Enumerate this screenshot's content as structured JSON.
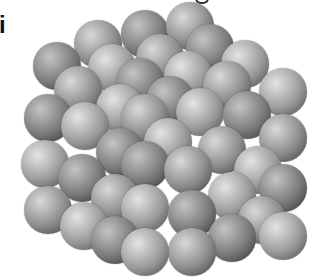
{
  "figure": {
    "label": "i",
    "sphere_radius": 24,
    "colors": {
      "highlight": "#d9d9d9",
      "mid": "#8c8c8c",
      "shadow": "#3a3a3a",
      "background": "#ffffff"
    },
    "spheres": [
      {
        "x": 98,
        "y": 44,
        "s": 0
      },
      {
        "x": 145,
        "y": 34,
        "s": 1
      },
      {
        "x": 190,
        "y": 26,
        "s": 0
      },
      {
        "x": 57,
        "y": 66,
        "s": 1
      },
      {
        "x": 112,
        "y": 68,
        "s": 2
      },
      {
        "x": 160,
        "y": 58,
        "s": 0
      },
      {
        "x": 210,
        "y": 48,
        "s": 1
      },
      {
        "x": 245,
        "y": 64,
        "s": 2
      },
      {
        "x": 140,
        "y": 82,
        "s": 1
      },
      {
        "x": 188,
        "y": 75,
        "s": 2
      },
      {
        "x": 78,
        "y": 90,
        "s": 0
      },
      {
        "x": 227,
        "y": 85,
        "s": 0
      },
      {
        "x": 120,
        "y": 108,
        "s": 2
      },
      {
        "x": 170,
        "y": 100,
        "s": 1
      },
      {
        "x": 283,
        "y": 92,
        "s": 2
      },
      {
        "x": 48,
        "y": 118,
        "s": 1
      },
      {
        "x": 145,
        "y": 118,
        "s": 0
      },
      {
        "x": 200,
        "y": 112,
        "s": 2
      },
      {
        "x": 247,
        "y": 115,
        "s": 1
      },
      {
        "x": 85,
        "y": 126,
        "s": 2
      },
      {
        "x": 283,
        "y": 138,
        "s": 0
      },
      {
        "x": 120,
        "y": 152,
        "s": 1
      },
      {
        "x": 168,
        "y": 142,
        "s": 2
      },
      {
        "x": 222,
        "y": 150,
        "s": 0
      },
      {
        "x": 45,
        "y": 164,
        "s": 2
      },
      {
        "x": 145,
        "y": 165,
        "s": 1
      },
      {
        "x": 188,
        "y": 170,
        "s": 0
      },
      {
        "x": 258,
        "y": 170,
        "s": 2
      },
      {
        "x": 82,
        "y": 178,
        "s": 1
      },
      {
        "x": 283,
        "y": 188,
        "s": 1
      },
      {
        "x": 115,
        "y": 198,
        "s": 0
      },
      {
        "x": 232,
        "y": 196,
        "s": 2
      },
      {
        "x": 48,
        "y": 210,
        "s": 0
      },
      {
        "x": 145,
        "y": 208,
        "s": 2
      },
      {
        "x": 192,
        "y": 214,
        "s": 1
      },
      {
        "x": 262,
        "y": 220,
        "s": 0
      },
      {
        "x": 84,
        "y": 226,
        "s": 2
      },
      {
        "x": 232,
        "y": 238,
        "s": 1
      },
      {
        "x": 283,
        "y": 236,
        "s": 2
      },
      {
        "x": 115,
        "y": 240,
        "s": 1
      },
      {
        "x": 192,
        "y": 252,
        "s": 0
      },
      {
        "x": 145,
        "y": 252,
        "s": 2
      }
    ]
  }
}
